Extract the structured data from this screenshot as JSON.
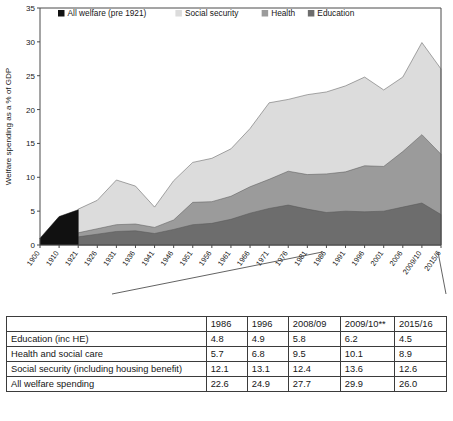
{
  "chart_data": {
    "type": "area",
    "stacked": true,
    "title": "",
    "xlabel": "",
    "ylabel": "Welfare spending as a % of GDP",
    "ylim": [
      0,
      35
    ],
    "ytick_step": 5,
    "yticks": [
      "0",
      "5",
      "10",
      "15",
      "20",
      "25",
      "30",
      "35"
    ],
    "grid": false,
    "legend_position": "top-left-inside",
    "legend": [
      {
        "label": "All welfare (pre 1921)",
        "color": "#111111"
      },
      {
        "label": "Social security",
        "color": "#dcdcdc"
      },
      {
        "label": "Health",
        "color": "#9b9b9b"
      },
      {
        "label": "Education",
        "color": "#6d6d6d"
      }
    ],
    "categories": [
      "1900",
      "1910",
      "1921",
      "1926",
      "1931",
      "1936",
      "1941",
      "1946",
      "1951",
      "1956",
      "1961",
      "1966",
      "1971",
      "1976",
      "1981",
      "1986",
      "1991",
      "1996",
      "2001",
      "2006",
      "2009/10",
      "2015/6"
    ],
    "series": [
      {
        "name": "All welfare (pre 1921)",
        "color": "#111111",
        "values": [
          1.0,
          4.2,
          5.2,
          null,
          null,
          null,
          null,
          null,
          null,
          null,
          null,
          null,
          null,
          null,
          null,
          null,
          null,
          null,
          null,
          null,
          null,
          null
        ]
      },
      {
        "name": "Education",
        "color": "#6d6d6d",
        "values": [
          null,
          null,
          1.2,
          1.6,
          2.0,
          2.1,
          1.7,
          2.3,
          3.0,
          3.2,
          3.8,
          4.7,
          5.4,
          5.9,
          5.3,
          4.8,
          5.0,
          4.9,
          5.0,
          5.6,
          6.2,
          4.5
        ]
      },
      {
        "name": "Health",
        "color": "#9b9b9b",
        "values": [
          null,
          null,
          0.6,
          0.8,
          1.0,
          1.0,
          0.9,
          1.4,
          3.3,
          3.2,
          3.4,
          3.9,
          4.3,
          5.0,
          5.1,
          5.7,
          5.8,
          6.8,
          6.6,
          8.2,
          10.1,
          8.9
        ]
      },
      {
        "name": "Social security",
        "color": "#dcdcdc",
        "values": [
          null,
          null,
          3.5,
          4.2,
          6.6,
          5.6,
          3.0,
          5.8,
          5.9,
          6.4,
          7.0,
          8.6,
          11.3,
          10.6,
          11.8,
          12.1,
          12.7,
          13.1,
          11.3,
          11.0,
          13.6,
          12.6
        ]
      }
    ],
    "totals": [
      1.0,
      4.2,
      5.2,
      6.6,
      9.6,
      8.7,
      5.6,
      9.5,
      12.2,
      12.8,
      14.2,
      17.2,
      21.0,
      21.5,
      22.2,
      22.6,
      23.5,
      24.9,
      22.9,
      24.8,
      29.9,
      26.0
    ],
    "annotations": [
      {
        "text": "",
        "type": "callout-line",
        "from": "1986",
        "to": "table-column-1986"
      },
      {
        "text": "",
        "type": "callout-line",
        "from": "2015/6",
        "to": "table-column-2015/16"
      }
    ]
  },
  "table": {
    "columns": [
      "",
      "1986",
      "1996",
      "2008/09",
      "2009/10**",
      "2015/16"
    ],
    "rows": [
      {
        "label": "Education (inc HE)",
        "values": [
          "4.8",
          "4.9",
          "5.8",
          "6.2",
          "4.5"
        ]
      },
      {
        "label": "Health and social care",
        "values": [
          "5.7",
          "6.8",
          "9.5",
          "10.1",
          "8.9"
        ]
      },
      {
        "label": "Social security (including housing benefit)",
        "values": [
          "12.1",
          "13.1",
          "12.4",
          "13.6",
          "12.6"
        ]
      },
      {
        "label": "All welfare spending",
        "values": [
          "22.6",
          "24.9",
          "27.7",
          "29.9",
          "26.0"
        ]
      }
    ]
  }
}
